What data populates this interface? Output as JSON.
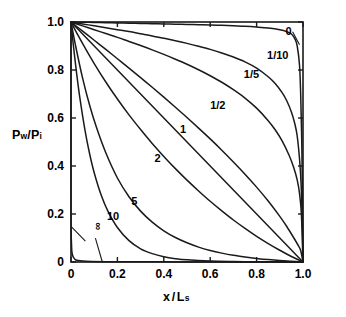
{
  "figure": {
    "background": "#ffffff",
    "ink": "#1a1a1a",
    "axis_x": {
      "label_main": "x",
      "label_slash": "/",
      "label_base": "L",
      "label_sub": "s",
      "label_full": "x/Ls",
      "ticks": [
        "0",
        "0.2",
        "0.4",
        "0.6",
        "0.8",
        "1.0"
      ],
      "tick_values": [
        0,
        0.2,
        0.4,
        0.6,
        0.8,
        1.0
      ],
      "range": [
        0,
        1.0
      ]
    },
    "axis_y": {
      "label_base1": "P",
      "label_sub1": "w",
      "label_slash": "/",
      "label_base2": "P",
      "label_sub2": "i",
      "label_full": "Pw/Pi",
      "ticks": [
        "0",
        "0.2",
        "0.4",
        "0.6",
        "0.8",
        "1.0"
      ],
      "tick_values": [
        0,
        0.2,
        0.4,
        0.6,
        0.8,
        1.0
      ],
      "range": [
        0,
        1.0
      ]
    }
  },
  "chart_data": {
    "type": "line",
    "title": "",
    "subtitle": "",
    "xlabel": "x/Ls",
    "ylabel": "Pw/Pi",
    "xlim": [
      0,
      1.0
    ],
    "ylim": [
      0,
      1.0
    ],
    "xticks": [
      0,
      0.2,
      0.4,
      0.6,
      0.8,
      1.0
    ],
    "yticks": [
      0,
      0.2,
      0.4,
      0.6,
      0.8,
      1.0
    ],
    "xticklabels": [
      "0",
      "0.2",
      "0.4",
      "0.6",
      "0.8",
      "1.0"
    ],
    "yticklabels": [
      "0",
      "0.2",
      "0.4",
      "0.6",
      "0.8",
      "1.0"
    ],
    "grid": false,
    "legend": "inline-curve-labels",
    "frame": "box-with-inward-ticks",
    "annotations": [
      {
        "text": "0",
        "x": 0.925,
        "y": 0.955,
        "leader_to": [
          0.985,
          0.905
        ]
      },
      {
        "text": "1/10",
        "x": 0.845,
        "y": 0.855,
        "leader_to": null
      },
      {
        "text": "1/5",
        "x": 0.745,
        "y": 0.775,
        "leader_to": null
      },
      {
        "text": "1/2",
        "x": 0.6,
        "y": 0.645,
        "leader_to": null
      },
      {
        "text": "1",
        "x": 0.47,
        "y": 0.545,
        "leader_to": null
      },
      {
        "text": "2",
        "x": 0.36,
        "y": 0.425,
        "leader_to": null
      },
      {
        "text": "5",
        "x": 0.26,
        "y": 0.245,
        "leader_to": null
      },
      {
        "text": "10",
        "x": 0.155,
        "y": 0.185,
        "leader_to": null
      },
      {
        "text": "∞",
        "x": 0.075,
        "y": 0.095,
        "leader_to": [
          0.135,
          0.0
        ]
      }
    ],
    "series": [
      {
        "name": "0",
        "label": "0",
        "x": [
          0.0,
          0.05,
          0.1,
          0.15,
          0.2,
          0.25,
          0.3,
          0.35,
          0.4,
          0.45,
          0.5,
          0.55,
          0.6,
          0.65,
          0.7,
          0.75,
          0.8,
          0.85,
          0.9,
          0.93,
          0.95,
          0.965,
          0.975,
          0.985,
          0.99,
          0.995,
          0.998,
          1.0
        ],
        "values": [
          1.0,
          0.999,
          0.998,
          0.997,
          0.996,
          0.995,
          0.994,
          0.993,
          0.992,
          0.991,
          0.99,
          0.989,
          0.988,
          0.986,
          0.984,
          0.982,
          0.979,
          0.975,
          0.968,
          0.96,
          0.95,
          0.93,
          0.9,
          0.82,
          0.7,
          0.48,
          0.24,
          0.0
        ]
      },
      {
        "name": "1/10",
        "label": "1/10",
        "x": [
          0.0,
          0.05,
          0.1,
          0.15,
          0.2,
          0.25,
          0.3,
          0.35,
          0.4,
          0.45,
          0.5,
          0.55,
          0.6,
          0.65,
          0.7,
          0.75,
          0.8,
          0.85,
          0.88,
          0.91,
          0.93,
          0.95,
          0.965,
          0.975,
          0.985,
          0.992,
          0.997,
          1.0
        ],
        "values": [
          1.0,
          0.992,
          0.984,
          0.976,
          0.968,
          0.96,
          0.951,
          0.942,
          0.932,
          0.922,
          0.911,
          0.899,
          0.886,
          0.871,
          0.854,
          0.834,
          0.808,
          0.772,
          0.744,
          0.706,
          0.672,
          0.625,
          0.575,
          0.525,
          0.43,
          0.32,
          0.17,
          0.0
        ]
      },
      {
        "name": "1/5",
        "label": "1/5",
        "x": [
          0.0,
          0.05,
          0.1,
          0.15,
          0.2,
          0.25,
          0.3,
          0.35,
          0.4,
          0.45,
          0.5,
          0.55,
          0.6,
          0.65,
          0.7,
          0.75,
          0.8,
          0.85,
          0.88,
          0.91,
          0.94,
          0.96,
          0.975,
          0.985,
          0.993,
          1.0
        ],
        "values": [
          1.0,
          0.984,
          0.968,
          0.952,
          0.936,
          0.919,
          0.902,
          0.884,
          0.865,
          0.845,
          0.824,
          0.801,
          0.776,
          0.749,
          0.718,
          0.683,
          0.641,
          0.589,
          0.551,
          0.505,
          0.445,
          0.394,
          0.342,
          0.286,
          0.2,
          0.0
        ]
      },
      {
        "name": "1/2",
        "label": "1/2",
        "x": [
          0.0,
          0.05,
          0.1,
          0.15,
          0.2,
          0.25,
          0.3,
          0.35,
          0.4,
          0.45,
          0.5,
          0.55,
          0.6,
          0.65,
          0.7,
          0.75,
          0.8,
          0.85,
          0.9,
          0.93,
          0.96,
          0.98,
          0.99,
          1.0
        ],
        "values": [
          1.0,
          0.962,
          0.924,
          0.886,
          0.847,
          0.808,
          0.768,
          0.728,
          0.687,
          0.645,
          0.602,
          0.558,
          0.513,
          0.466,
          0.417,
          0.366,
          0.312,
          0.254,
          0.19,
          0.148,
          0.101,
          0.068,
          0.048,
          0.0
        ]
      },
      {
        "name": "1",
        "label": "1",
        "x": [
          0.0,
          0.05,
          0.1,
          0.15,
          0.2,
          0.25,
          0.3,
          0.35,
          0.4,
          0.45,
          0.5,
          0.55,
          0.6,
          0.65,
          0.7,
          0.75,
          0.8,
          0.85,
          0.9,
          0.95,
          1.0
        ],
        "values": [
          1.0,
          0.95,
          0.9,
          0.85,
          0.8,
          0.75,
          0.7,
          0.65,
          0.6,
          0.55,
          0.5,
          0.45,
          0.4,
          0.35,
          0.3,
          0.25,
          0.2,
          0.15,
          0.1,
          0.05,
          0.0
        ]
      },
      {
        "name": "2",
        "label": "2",
        "x": [
          0.0,
          0.03,
          0.06,
          0.1,
          0.15,
          0.2,
          0.25,
          0.3,
          0.35,
          0.4,
          0.45,
          0.5,
          0.55,
          0.6,
          0.65,
          0.7,
          0.75,
          0.8,
          0.85,
          0.9,
          0.95,
          1.0
        ],
        "values": [
          1.0,
          0.945,
          0.893,
          0.827,
          0.75,
          0.679,
          0.613,
          0.552,
          0.494,
          0.44,
          0.389,
          0.341,
          0.296,
          0.253,
          0.213,
          0.175,
          0.14,
          0.107,
          0.077,
          0.049,
          0.023,
          0.0
        ]
      },
      {
        "name": "5",
        "label": "5",
        "x": [
          0.0,
          0.02,
          0.05,
          0.08,
          0.11,
          0.15,
          0.2,
          0.25,
          0.3,
          0.35,
          0.4,
          0.45,
          0.5,
          0.55,
          0.6,
          0.65,
          0.7,
          0.75,
          0.8,
          0.85,
          0.9,
          0.95,
          1.0
        ],
        "values": [
          1.0,
          0.9,
          0.766,
          0.654,
          0.56,
          0.455,
          0.35,
          0.272,
          0.212,
          0.166,
          0.13,
          0.102,
          0.08,
          0.062,
          0.048,
          0.037,
          0.028,
          0.021,
          0.015,
          0.01,
          0.006,
          0.003,
          0.0
        ]
      },
      {
        "name": "10",
        "label": "10",
        "x": [
          0.0,
          0.01,
          0.025,
          0.04,
          0.06,
          0.08,
          0.1,
          0.13,
          0.16,
          0.2,
          0.25,
          0.3,
          0.35,
          0.4,
          0.45,
          0.5,
          0.6,
          0.7,
          0.8,
          0.9,
          1.0
        ],
        "values": [
          1.0,
          0.905,
          0.78,
          0.672,
          0.551,
          0.452,
          0.372,
          0.279,
          0.21,
          0.144,
          0.089,
          0.055,
          0.035,
          0.022,
          0.014,
          0.009,
          0.004,
          0.002,
          0.001,
          0.0005,
          0.0
        ]
      },
      {
        "name": "infinity",
        "label": "∞",
        "x": [
          0.0,
          0.0,
          0.002,
          0.01,
          0.05,
          0.2,
          0.5,
          0.8,
          1.0
        ],
        "values": [
          1.0,
          0.25,
          0.08,
          0.02,
          0.004,
          0.001,
          0.0005,
          0.0002,
          0.0
        ]
      }
    ]
  }
}
